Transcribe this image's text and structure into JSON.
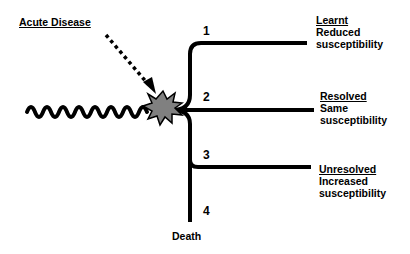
{
  "diagram": {
    "title_label": "Acute Disease",
    "starburst_color": "#808080",
    "branches": [
      {
        "number": "1",
        "heading": "Learnt",
        "line1": "Reduced",
        "line2": "susceptibility"
      },
      {
        "number": "2",
        "heading": "Resolved",
        "line1": "Same",
        "line2": "susceptibility"
      },
      {
        "number": "3",
        "heading": "Unresolved",
        "line1": "Increased",
        "line2": "susceptibility"
      },
      {
        "number": "4",
        "terminal": "Death"
      }
    ]
  }
}
